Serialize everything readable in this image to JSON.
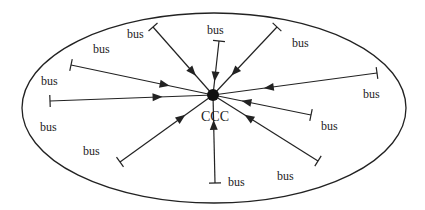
{
  "diagram": {
    "type": "star-topology",
    "colors": {
      "stroke": "#222222",
      "background": "#ffffff"
    },
    "boundary": {
      "shape": "ellipse",
      "cx": 214,
      "cy": 108,
      "rx": 192,
      "ry": 95
    },
    "center": {
      "label": "CCC",
      "x": 213,
      "y": 95,
      "r": 6,
      "label_x": 215,
      "label_y": 121
    },
    "spokes": [
      {
        "id": "upper-left",
        "x": 153,
        "y": 27,
        "label": "bus",
        "lx": 127,
        "ly": 38
      },
      {
        "id": "top",
        "x": 219,
        "y": 41,
        "label": "bus",
        "lx": 207,
        "ly": 34
      },
      {
        "id": "upper-right",
        "x": 277,
        "y": 27,
        "label": "bus",
        "lx": 292,
        "ly": 47
      },
      {
        "id": "left-upper",
        "x": 71,
        "y": 65,
        "label": "bus",
        "lx": 93,
        "ly": 53
      },
      {
        "id": "right",
        "x": 377,
        "y": 73,
        "label": "bus",
        "lx": 363,
        "ly": 98
      },
      {
        "id": "left",
        "x": 50,
        "y": 101,
        "label": "bus",
        "lx": 41,
        "ly": 85
      },
      {
        "id": "right-lower",
        "x": 311,
        "y": 115,
        "label": "bus",
        "lx": 321,
        "ly": 130
      },
      {
        "id": "lower-left",
        "x": 120,
        "y": 162,
        "label": "bus",
        "lx": 83,
        "ly": 155
      },
      {
        "id": "lower-right",
        "x": 318,
        "y": 161,
        "label": "bus",
        "lx": 277,
        "ly": 180
      },
      {
        "id": "bottom",
        "x": 215,
        "y": 183,
        "label": "bus",
        "lx": 228,
        "ly": 186
      }
    ],
    "extra_labels": [
      {
        "label": "bus",
        "x": 40,
        "y": 131
      }
    ]
  }
}
